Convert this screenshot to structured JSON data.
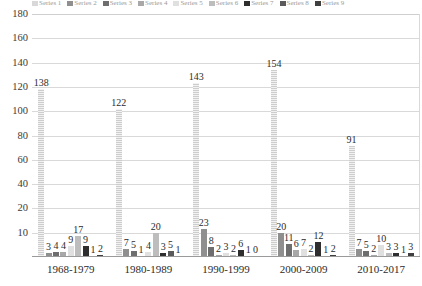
{
  "chart_data": {
    "type": "bar",
    "title": "",
    "subtitle": "",
    "xlabel": "",
    "ylabel": "",
    "grid": true,
    "legend_position": "top",
    "legend_visible_cropped": true,
    "ylim": [
      10,
      180
    ],
    "ytick_labels": [
      "180",
      "160",
      "140",
      "120",
      "100",
      "80",
      "60",
      "40",
      "20",
      "10"
    ],
    "ytick_values": [
      180,
      160,
      140,
      120,
      100,
      80,
      60,
      40,
      20,
      10
    ],
    "categories": [
      "1968-1979",
      "1980-1989",
      "1990-1999",
      "2000-2009",
      "2010-2017"
    ],
    "series": [
      {
        "name": "Series 1",
        "color": "#d8d8d8",
        "values": [
          138,
          122,
          143,
          154,
          91
        ]
      },
      {
        "name": "Series 2",
        "color": "#8f8f8f",
        "values": [
          3,
          7,
          23,
          20,
          7
        ]
      },
      {
        "name": "Series 3",
        "color": "#6e6e6e",
        "values": [
          4,
          5,
          8,
          11,
          5
        ]
      },
      {
        "name": "Series 4",
        "color": "#a8a8a8",
        "values": [
          4,
          1,
          2,
          6,
          2
        ]
      },
      {
        "name": "Series 5",
        "color": "#e0e0e0",
        "values": [
          9,
          4,
          3,
          7,
          10
        ]
      },
      {
        "name": "Series 6",
        "color": "#bdbdbd",
        "values": [
          17,
          20,
          2,
          2,
          3
        ]
      },
      {
        "name": "Series 7",
        "color": "#2e2e2e",
        "values": [
          9,
          3,
          6,
          12,
          3
        ]
      },
      {
        "name": "Series 8",
        "color": "#5a5a5a",
        "values": [
          1,
          5,
          1,
          1,
          1
        ]
      },
      {
        "name": "Series 9",
        "color": "#3f3f3f",
        "values": [
          2,
          1,
          0,
          2,
          3
        ]
      }
    ],
    "data_labels": [
      [
        "138",
        "3",
        "4",
        "4",
        "9",
        "17",
        "9",
        "1",
        "2"
      ],
      [
        "122",
        "7",
        "5",
        "1",
        "4",
        "20",
        "3",
        "5",
        "1"
      ],
      [
        "143",
        "23",
        "8",
        "2",
        "3",
        "2",
        "6",
        "1",
        "0"
      ],
      [
        "154",
        "20",
        "11",
        "6",
        "7",
        "2",
        "12",
        "1",
        "2"
      ],
      [
        "91",
        "7",
        "5",
        "2",
        "10",
        "3",
        "3",
        "1",
        "3"
      ]
    ]
  }
}
